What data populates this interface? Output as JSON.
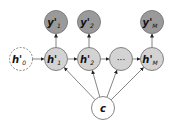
{
  "diagram": {
    "type": "graphical-model",
    "nodes": [
      {
        "id": "h0",
        "label": "h'",
        "sub": "0",
        "x": 21,
        "y": 59,
        "style": "dashed",
        "fill": "#ffffff"
      },
      {
        "id": "h1",
        "label": "h'",
        "sub": "1",
        "x": 56,
        "y": 59,
        "style": "solid",
        "fill": "#d3d3d3"
      },
      {
        "id": "h2",
        "label": "h'",
        "sub": "2",
        "x": 89,
        "y": 59,
        "style": "solid",
        "fill": "#d3d3d3"
      },
      {
        "id": "hdots",
        "label": "···",
        "sub": "",
        "x": 121,
        "y": 59,
        "style": "solid",
        "fill": "#d3d3d3"
      },
      {
        "id": "hM",
        "label": "h'",
        "sub": "M",
        "x": 152,
        "y": 59,
        "style": "solid",
        "fill": "#d3d3d3"
      },
      {
        "id": "y1",
        "label": "y'",
        "sub": "1",
        "x": 56,
        "y": 22,
        "style": "solid",
        "fill": "#9a9a9a"
      },
      {
        "id": "y2",
        "label": "y'",
        "sub": "2",
        "x": 89,
        "y": 22,
        "style": "solid",
        "fill": "#9a9a9a"
      },
      {
        "id": "yM",
        "label": "y'",
        "sub": "M",
        "x": 152,
        "y": 22,
        "style": "solid",
        "fill": "#9a9a9a"
      },
      {
        "id": "c",
        "label": "c",
        "sub": "",
        "x": 103,
        "y": 108,
        "style": "solid",
        "fill": "#ffffff"
      }
    ],
    "edges": [
      [
        "h0",
        "h1"
      ],
      [
        "h1",
        "h2"
      ],
      [
        "h2",
        "hdots"
      ],
      [
        "hdots",
        "hM"
      ],
      [
        "h1",
        "y1"
      ],
      [
        "h2",
        "y2"
      ],
      [
        "hM",
        "yM"
      ],
      [
        "c",
        "h1"
      ],
      [
        "c",
        "h2"
      ],
      [
        "c",
        "hdots"
      ],
      [
        "c",
        "hM"
      ]
    ],
    "colors": {
      "stroke": "#777777",
      "hidden": "#d3d3d3",
      "output": "#9a9a9a",
      "context": "#ffffff"
    }
  }
}
